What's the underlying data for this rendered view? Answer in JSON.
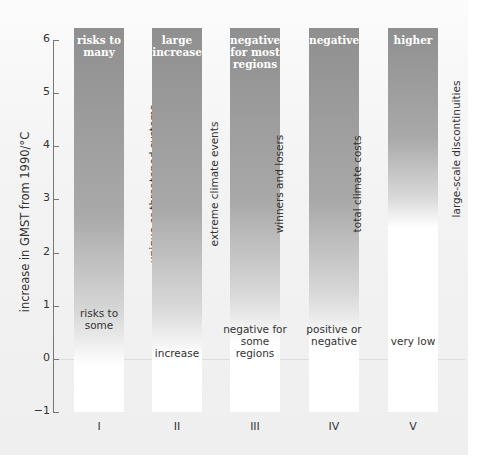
{
  "chart_data": {
    "type": "bar",
    "title": "",
    "ylabel": "increase in GMST from 1990/°C",
    "ylim": [
      -1,
      6
    ],
    "yticks": [
      "6",
      "5",
      "4",
      "3",
      "2",
      "1",
      "0",
      "−1"
    ],
    "categories": [
      "I",
      "II",
      "III",
      "IV",
      "V"
    ],
    "series": [
      {
        "name": "I",
        "risk": "unique or threatened systems",
        "high": "risks to many",
        "low": "risks to some"
      },
      {
        "name": "II",
        "risk": "extreme climate events",
        "high": "large increase",
        "low": "increase"
      },
      {
        "name": "III",
        "risk": "winners and losers",
        "high": "negative for most regions",
        "low": "negative for some regions"
      },
      {
        "name": "IV",
        "risk": "total climate costs",
        "high": "negative",
        "low": "positive or negative"
      },
      {
        "name": "V",
        "risk": "large-scale discontinuities",
        "high": "higher",
        "low": "very low"
      }
    ],
    "grid": false
  },
  "bars": [
    {
      "roman": "I",
      "top": "risks to many",
      "mid": "unique or threatened systems",
      "low": "risks to some"
    },
    {
      "roman": "II",
      "top": "large increase",
      "mid": "extreme climate events",
      "low": "increase"
    },
    {
      "roman": "III",
      "top": "negative for most regions",
      "mid": "winners and losers",
      "low": "negative for some regions"
    },
    {
      "roman": "IV",
      "top": "negative",
      "mid": "total climate costs",
      "low": "positive or negative"
    },
    {
      "roman": "V",
      "top": "higher",
      "mid": "large-scale discontinuities",
      "low": "very low"
    }
  ],
  "colors": {
    "bar_dark": "#8f8f8f",
    "bar_light": "#ffffff"
  }
}
